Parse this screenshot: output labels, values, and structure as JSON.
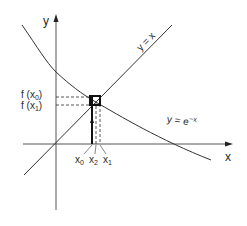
{
  "diagram": {
    "axes": {
      "x_label": "x",
      "y_label": "y"
    },
    "curves": [
      {
        "name": "identity-line",
        "label_base": "y = x",
        "color": "#333333"
      },
      {
        "name": "exp-decay-curve",
        "label_base": "y = e",
        "label_exp": "−x",
        "color": "#333333"
      }
    ],
    "y_ticks": [
      {
        "base": "f (x",
        "sub": "0",
        "close": ")"
      },
      {
        "base": "f (x",
        "sub": "1",
        "close": ")"
      }
    ],
    "x_ticks": [
      {
        "base": "x",
        "sub": "0"
      },
      {
        "base": "x",
        "sub": "2"
      },
      {
        "base": "x",
        "sub": "1"
      }
    ],
    "colors": {
      "line": "#333333",
      "axis": "#444444",
      "background": "#ffffff"
    }
  }
}
